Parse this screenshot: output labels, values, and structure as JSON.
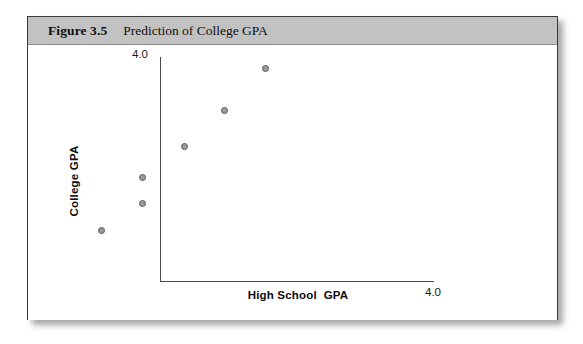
{
  "figure": {
    "number_label": "Figure 3.5",
    "caption": "Prediction of College GPA"
  },
  "chart_data": {
    "type": "scatter",
    "title": "Prediction of College GPA",
    "xlabel": "High School  GPA",
    "ylabel": "College GPA",
    "xlim": [
      0,
      4.0
    ],
    "ylim": [
      0,
      4.0
    ],
    "x_tick_labels": [
      "4.0"
    ],
    "y_tick_labels": [
      "4.0"
    ],
    "grid": false,
    "legend": "none",
    "marker": {
      "shape": "circle",
      "fill_color": "#9a9a9a",
      "edge_color": "#5c5c5c",
      "size_px": 7
    },
    "points": [
      {
        "x": 1.08,
        "y": 1.4
      },
      {
        "x": 1.68,
        "y": 1.8
      },
      {
        "x": 1.68,
        "y": 2.18
      },
      {
        "x": 2.3,
        "y": 2.63
      },
      {
        "x": 2.89,
        "y": 3.16
      },
      {
        "x": 3.48,
        "y": 3.77
      }
    ],
    "axis_color": "#4a4a4a"
  },
  "pixel_layout": {
    "points_px": [
      {
        "left": 70,
        "top": 182
      },
      {
        "left": 111,
        "top": 155
      },
      {
        "left": 111,
        "top": 129
      },
      {
        "left": 153,
        "top": 98
      },
      {
        "left": 193,
        "top": 62
      },
      {
        "left": 234,
        "top": 20
      }
    ]
  },
  "colors": {
    "header_band": "#c2c2c2",
    "frame_border": "#3a3a3a",
    "page_background": "#ffffff"
  }
}
